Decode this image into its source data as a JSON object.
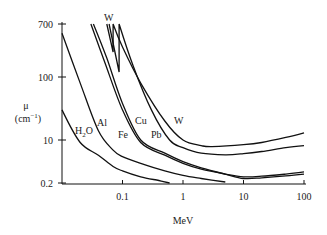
{
  "chart_data": {
    "type": "line",
    "title": "",
    "xlabel": "MeV",
    "ylabel": "μ",
    "ylabel_unit": "(cm⁻¹)",
    "x_scale": "log",
    "y_scale": "log",
    "xlim": [
      0.01,
      100
    ],
    "ylim": [
      0.2,
      700
    ],
    "x_ticks": [
      {
        "value": 0.1,
        "label": "0.1"
      },
      {
        "value": 1,
        "label": "1"
      },
      {
        "value": 10,
        "label": "10"
      },
      {
        "value": 100,
        "label": "100"
      }
    ],
    "y_ticks": [
      {
        "value": 0.2,
        "label": "0.2"
      },
      {
        "value": 10,
        "label": "10"
      },
      {
        "value": 100,
        "label": "100"
      },
      {
        "value": 700,
        "label": "700"
      }
    ],
    "grid": false,
    "legend": "none",
    "series": [
      {
        "name": "H2O",
        "label": "H₂O",
        "points": [
          [
            0.01,
            30
          ],
          [
            0.02,
            8
          ],
          [
            0.04,
            2.5
          ],
          [
            0.07,
            0.9
          ],
          [
            0.1,
            0.6
          ],
          [
            0.2,
            0.35
          ],
          [
            0.4,
            0.25
          ],
          [
            0.6,
            0.2
          ]
        ]
      },
      {
        "name": "Al",
        "label": "Al",
        "points": [
          [
            0.01,
            500
          ],
          [
            0.02,
            80
          ],
          [
            0.04,
            14
          ],
          [
            0.07,
            4
          ],
          [
            0.1,
            2.2
          ],
          [
            0.2,
            1.2
          ],
          [
            0.5,
            0.6
          ],
          [
            1,
            0.4
          ],
          [
            2,
            0.3
          ],
          [
            5,
            0.22
          ]
        ]
      },
      {
        "name": "Fe",
        "label": "Fe",
        "points": [
          [
            0.03,
            700
          ],
          [
            0.05,
            180
          ],
          [
            0.1,
            30
          ],
          [
            0.2,
            8
          ],
          [
            0.5,
            2.5
          ],
          [
            1,
            1.2
          ],
          [
            2,
            0.7
          ],
          [
            5,
            0.45
          ],
          [
            10,
            0.35
          ],
          [
            20,
            0.37
          ],
          [
            50,
            0.45
          ],
          [
            100,
            0.55
          ]
        ]
      },
      {
        "name": "Cu",
        "label": "Cu",
        "points": [
          [
            0.033,
            700
          ],
          [
            0.055,
            200
          ],
          [
            0.1,
            38
          ],
          [
            0.2,
            10
          ],
          [
            0.5,
            3
          ],
          [
            1,
            1.4
          ],
          [
            2,
            0.8
          ],
          [
            5,
            0.45
          ],
          [
            10,
            0.3
          ],
          [
            20,
            0.32
          ],
          [
            50,
            0.38
          ],
          [
            100,
            0.45
          ]
        ]
      },
      {
        "name": "Pb",
        "label": "Pb",
        "points": [
          [
            0.06,
            700
          ],
          [
            0.088,
            120
          ],
          [
            0.088,
            700
          ],
          [
            0.15,
            150
          ],
          [
            0.3,
            30
          ],
          [
            0.6,
            10
          ],
          [
            1,
            5
          ],
          [
            2,
            3
          ],
          [
            5,
            2.6
          ],
          [
            10,
            2.9
          ],
          [
            20,
            3.5
          ],
          [
            50,
            5
          ],
          [
            100,
            6
          ]
        ]
      },
      {
        "name": "W",
        "label": "W",
        "points": [
          [
            0.055,
            700
          ],
          [
            0.07,
            250
          ],
          [
            0.07,
            700
          ],
          [
            0.1,
            300
          ],
          [
            0.2,
            80
          ],
          [
            0.5,
            20
          ],
          [
            1,
            10
          ],
          [
            2,
            6
          ],
          [
            3,
            5.5
          ],
          [
            10,
            6.5
          ],
          [
            20,
            8
          ],
          [
            50,
            11
          ],
          [
            100,
            13
          ]
        ]
      }
    ],
    "annotations": [
      {
        "text": "W",
        "near": "absorption edge top"
      },
      {
        "text": "H₂O"
      },
      {
        "text": "Al"
      },
      {
        "text": "Fe"
      },
      {
        "text": "Cu"
      },
      {
        "text": "Pb"
      },
      {
        "text": "W"
      }
    ]
  },
  "labels": {
    "edge_w": "W",
    "h2o_main": "H",
    "h2o_sub": "2",
    "h2o_tail": "O",
    "al": "Al",
    "fe": "Fe",
    "cu": "Cu",
    "pb": "Pb",
    "w": "W",
    "mu": "μ",
    "mu_unit_open": "(cm",
    "mu_unit_sup": "−1",
    "mu_unit_close": ")",
    "xlabel": "MeV"
  }
}
